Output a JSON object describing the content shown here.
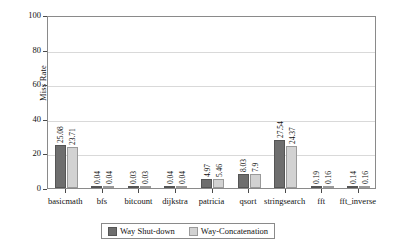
{
  "chart_data": {
    "type": "bar",
    "title": "",
    "xlabel": "",
    "ylabel": "Miss Rate",
    "ylim": [
      0,
      100
    ],
    "yticks": [
      0,
      20,
      40,
      60,
      80,
      100
    ],
    "grid": true,
    "legend_position": "bottom",
    "categories": [
      "basicmath",
      "bfs",
      "bitcount",
      "dijkstra",
      "patricia",
      "qsort",
      "stringsearch",
      "fft",
      "fft_inverse"
    ],
    "series": [
      {
        "name": "Way Shut-down",
        "color": "#6e6e6e",
        "values": [
          25.08,
          0.04,
          0.03,
          0.04,
          4.97,
          8.03,
          27.54,
          0.19,
          0.14
        ],
        "labels": [
          "25.08",
          "0.04",
          "0.03",
          "0.04",
          "4.97",
          "8.03",
          "27.54",
          "0.19",
          "0.14"
        ]
      },
      {
        "name": "Way-Concatenation",
        "color": "#d2d2d2",
        "values": [
          23.71,
          0.04,
          0.03,
          0.04,
          5.46,
          7.9,
          24.37,
          0.16,
          0.16
        ],
        "labels": [
          "23.71",
          "0.04",
          "0.03",
          "0.04",
          "5.46",
          "7.9",
          "24.37",
          "0.16",
          "0.16"
        ]
      }
    ]
  }
}
